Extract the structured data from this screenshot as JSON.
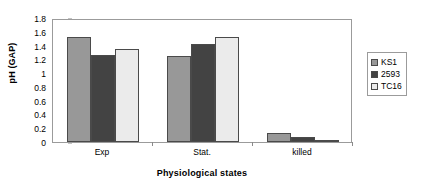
{
  "chart_data": {
    "type": "bar",
    "title": "",
    "xlabel": "Physiological states",
    "ylabel": "pH (GAP)",
    "categories": [
      "Exp",
      "Stat.",
      "killed"
    ],
    "series": [
      {
        "name": "KS1",
        "values": [
          1.53,
          1.25,
          0.13
        ],
        "color": "#989898"
      },
      {
        "name": "2593",
        "values": [
          1.27,
          1.42,
          0.08
        ],
        "color": "#434343"
      },
      {
        "name": "TC16",
        "values": [
          1.35,
          1.53,
          0.01
        ],
        "color": "#ebebeb"
      }
    ],
    "ylim": [
      0,
      1.8
    ],
    "ytick_labels": [
      "0",
      "0.2",
      "0.4",
      "0.6",
      "0.8",
      "1",
      "1.2",
      "1.4",
      "1.6",
      "1.8"
    ],
    "ytick_values": [
      0,
      0.2,
      0.4,
      0.6,
      0.8,
      1.0,
      1.2,
      1.4,
      1.6,
      1.8
    ],
    "grid": false,
    "legend_position": "right",
    "legend_entries": [
      "KS1",
      "2593",
      "TC16"
    ]
  },
  "axes": {
    "y_title": "pH (GAP)",
    "x_title": "Physiological states"
  },
  "legend": {
    "items": [
      {
        "label": "KS1"
      },
      {
        "label": "2593"
      },
      {
        "label": "TC16"
      }
    ]
  }
}
